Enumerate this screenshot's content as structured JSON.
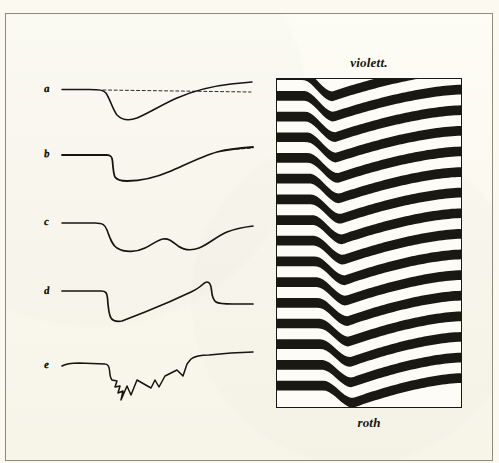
{
  "plate": {
    "title": "Interference fringe plate with spectral displacement curves",
    "background_color": "#fbf9f0",
    "ink_color": "#15140e",
    "frame_color": "#8d8a7c"
  },
  "fringe_panel": {
    "top_label": "violett.",
    "bottom_label": "roth",
    "band_count": 16,
    "band_color": "#1a1812",
    "gap_color": "#fdfcf6",
    "border_color": "#1a1812",
    "description": "Horizontal interference fringes bending downward in a V near the left third, then sloping gently upward to the right edge."
  },
  "curves": {
    "count": 5,
    "items": [
      {
        "label": "a",
        "name": "curve-a",
        "has_dashed_baseline": true,
        "description": "Flat baseline, smooth rounded dip, slow linear recovery rising above the baseline."
      },
      {
        "label": "b",
        "name": "curve-b",
        "has_dashed_baseline": true,
        "description": "Flat baseline, abrupt vertical step down, flat trough, long S-shaped rise to the right."
      },
      {
        "label": "c",
        "name": "curve-c",
        "has_dashed_baseline": false,
        "description": "Step down into a broad trough, secondary hump, second shallow trough, then rise to a flat plateau."
      },
      {
        "label": "d",
        "name": "curve-d",
        "has_dashed_baseline": false,
        "description": "Sharp step down to a V trough, straight linear climb to a peak, sharp step down to a flat tail."
      },
      {
        "label": "e",
        "name": "curve-e",
        "has_dashed_baseline": false,
        "description": "Flat start, then a jagged saw-toothed sequence of sharp notches climbing to the right."
      }
    ]
  },
  "chart_data": {
    "type": "line",
    "xlabel": "",
    "ylabel": "",
    "annotations": [
      "violett.",
      "roth"
    ],
    "legend_position": "left-inline",
    "grid": false,
    "series": [
      {
        "name": "a",
        "x": [
          0,
          10,
          22,
          30,
          36,
          42,
          50,
          58,
          66,
          74,
          82,
          90,
          100
        ],
        "values": [
          0,
          0,
          0,
          -2,
          -22,
          -36,
          -38,
          -30,
          -18,
          -8,
          0,
          5,
          8
        ]
      },
      {
        "name": "b",
        "x": [
          0,
          10,
          22,
          32,
          34,
          38,
          48,
          58,
          68,
          78,
          88,
          100
        ],
        "values": [
          0,
          0,
          0,
          0,
          -30,
          -40,
          -42,
          -38,
          -26,
          -12,
          -2,
          6
        ]
      },
      {
        "name": "c",
        "x": [
          0,
          12,
          24,
          30,
          36,
          44,
          52,
          58,
          66,
          74,
          82,
          92,
          100
        ],
        "values": [
          0,
          0,
          0,
          -10,
          -32,
          -34,
          -22,
          -14,
          -22,
          -28,
          -14,
          -2,
          0
        ]
      },
      {
        "name": "d",
        "x": [
          0,
          14,
          26,
          30,
          34,
          40,
          50,
          62,
          72,
          78,
          82,
          86,
          100
        ],
        "values": [
          0,
          0,
          0,
          -14,
          -38,
          -44,
          -34,
          -20,
          -6,
          8,
          10,
          -12,
          -14
        ]
      },
      {
        "name": "e",
        "x": [
          0,
          14,
          26,
          30,
          34,
          38,
          42,
          46,
          52,
          58,
          64,
          70,
          76,
          80,
          84,
          100
        ],
        "values": [
          0,
          0,
          0,
          -12,
          -24,
          -14,
          -34,
          -50,
          -30,
          -18,
          -26,
          -14,
          -6,
          4,
          -10,
          -2
        ]
      }
    ]
  }
}
